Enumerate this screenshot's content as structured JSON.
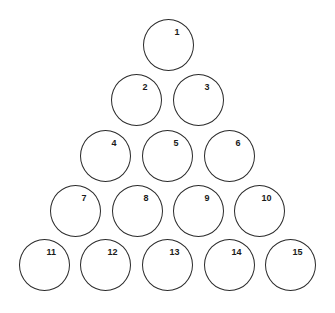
{
  "diagram": {
    "stroke_color": "#2a2a2a",
    "background": "#ffffff",
    "circle_diameter": 51,
    "rows": [
      [
        {
          "label": "1",
          "cx": 168,
          "cy": 45
        }
      ],
      [
        {
          "label": "2",
          "cx": 136,
          "cy": 100
        },
        {
          "label": "3",
          "cx": 198,
          "cy": 100
        }
      ],
      [
        {
          "label": "4",
          "cx": 105,
          "cy": 156
        },
        {
          "label": "5",
          "cx": 167,
          "cy": 156
        },
        {
          "label": "6",
          "cx": 229,
          "cy": 156
        }
      ],
      [
        {
          "label": "7",
          "cx": 75,
          "cy": 211
        },
        {
          "label": "8",
          "cx": 137,
          "cy": 211
        },
        {
          "label": "9",
          "cx": 198,
          "cy": 211
        },
        {
          "label": "10",
          "cx": 259,
          "cy": 211
        }
      ],
      [
        {
          "label": "11",
          "cx": 44,
          "cy": 265
        },
        {
          "label": "12",
          "cx": 105,
          "cy": 265
        },
        {
          "label": "13",
          "cx": 167,
          "cy": 265
        },
        {
          "label": "14",
          "cx": 229,
          "cy": 265
        },
        {
          "label": "15",
          "cx": 290,
          "cy": 265
        }
      ]
    ]
  }
}
